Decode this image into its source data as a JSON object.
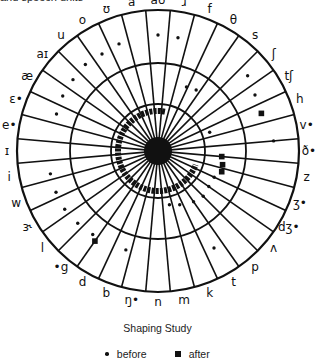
{
  "header": {
    "caption": "and speech units"
  },
  "diagram": {
    "title": "Shaping Study",
    "center": [
      158,
      151
    ],
    "rings": {
      "outer": 141,
      "middle": 88,
      "inner": 47,
      "arc": 40,
      "hub": 14
    },
    "spoke_count": 36,
    "start_angle_deg": -100,
    "colors": {
      "ink": "#111111",
      "background": "#ffffff"
    },
    "labels": [
      "a",
      "aʊ",
      "ɹ",
      "f",
      "θ",
      "s",
      "ʃ",
      "tʃ",
      "h",
      "v•",
      "ð•",
      "z",
      "ʒ•",
      "dʒ•",
      "ʌ",
      "p",
      "t",
      "k",
      "m",
      "n",
      "ŋ•",
      "b",
      "d",
      "•g",
      "l",
      "ɝ",
      "w",
      "i",
      "ɪ",
      "e•",
      "ɛ•",
      "æ",
      "aɪ",
      "u",
      "o",
      "ʊ"
    ],
    "before_points": [
      {
        "a": -90,
        "r": 116
      },
      {
        "a": -80,
        "r": 115
      },
      {
        "a": -110,
        "r": 114
      },
      {
        "a": -120,
        "r": 112
      },
      {
        "a": -130,
        "r": 113
      },
      {
        "a": -140,
        "r": 111
      },
      {
        "a": -150,
        "r": 110
      },
      {
        "a": -160,
        "r": 108
      },
      {
        "a": -40,
        "r": 117
      },
      {
        "a": -30,
        "r": 112
      },
      {
        "a": -5,
        "r": 116
      },
      {
        "a": -66,
        "r": 70
      },
      {
        "a": -58,
        "r": 72
      },
      {
        "a": -20,
        "r": 55
      },
      {
        "a": 168,
        "r": 110
      },
      {
        "a": 158,
        "r": 110
      },
      {
        "a": 148,
        "r": 110
      },
      {
        "a": 138,
        "r": 108
      },
      {
        "a": 128,
        "r": 106
      },
      {
        "a": 108,
        "r": 104
      },
      {
        "a": 60,
        "r": 112
      },
      {
        "a": 25,
        "r": 62
      },
      {
        "a": 35,
        "r": 62
      },
      {
        "a": 45,
        "r": 64
      },
      {
        "a": 55,
        "r": 62
      },
      {
        "a": 68,
        "r": 58
      },
      {
        "a": 78,
        "r": 55
      }
    ],
    "after_points": [
      {
        "a": -20,
        "r": 110
      },
      {
        "a": 5,
        "r": 64
      },
      {
        "a": 12,
        "r": 66
      },
      {
        "a": 18,
        "r": 67
      },
      {
        "a": 125,
        "r": 110
      }
    ],
    "arc": {
      "start_deg": -80,
      "end_deg": 20,
      "width": 6
    }
  },
  "legend": {
    "items": [
      {
        "marker": "dot",
        "label": "before"
      },
      {
        "marker": "square",
        "label": "after"
      }
    ]
  }
}
